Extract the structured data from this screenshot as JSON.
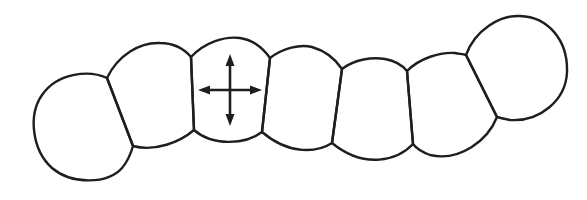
{
  "diagram": {
    "title": "Chain of cells with central cell showing bidirectional expansion arrows",
    "stroke_color": "#1e1e1e",
    "background": "#ffffff",
    "cells": [
      {
        "id": "cell-1",
        "label": "end cell (left)"
      },
      {
        "id": "cell-2",
        "label": "cell"
      },
      {
        "id": "cell-3",
        "label": "marked cell with arrows"
      },
      {
        "id": "cell-4",
        "label": "cell"
      },
      {
        "id": "cell-5",
        "label": "cell"
      },
      {
        "id": "cell-6",
        "label": "cell"
      },
      {
        "id": "cell-7",
        "label": "end cell (right)"
      }
    ],
    "arrows": {
      "type": "four-way",
      "directions": [
        "up",
        "down",
        "left",
        "right"
      ],
      "icon": "move-arrows-icon"
    }
  }
}
